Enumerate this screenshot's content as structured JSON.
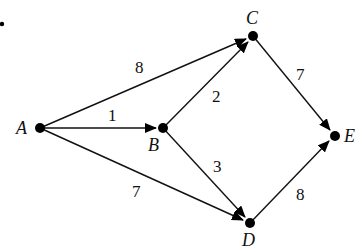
{
  "diagram": {
    "type": "weighted directed graph",
    "nodes": [
      {
        "id": "A",
        "label": "A",
        "x": 40,
        "y": 128
      },
      {
        "id": "B",
        "label": "B",
        "x": 163,
        "y": 128
      },
      {
        "id": "C",
        "label": "C",
        "x": 253,
        "y": 36
      },
      {
        "id": "D",
        "label": "D",
        "x": 250,
        "y": 223
      },
      {
        "id": "E",
        "label": "E",
        "x": 335,
        "y": 136
      }
    ],
    "edges": [
      {
        "from": "A",
        "to": "C",
        "weight": "8"
      },
      {
        "from": "A",
        "to": "B",
        "weight": "1"
      },
      {
        "from": "A",
        "to": "D",
        "weight": "7"
      },
      {
        "from": "B",
        "to": "C",
        "weight": "2"
      },
      {
        "from": "B",
        "to": "D",
        "weight": "3"
      },
      {
        "from": "C",
        "to": "E",
        "weight": "7"
      },
      {
        "from": "D",
        "to": "E",
        "weight": "8"
      }
    ]
  },
  "labels": {
    "A": "A",
    "B": "B",
    "C": "C",
    "D": "D",
    "E": "E",
    "w_AC": "8",
    "w_AB": "1",
    "w_AD": "7",
    "w_BC": "2",
    "w_BD": "3",
    "w_CE": "7",
    "w_DE": "8"
  }
}
